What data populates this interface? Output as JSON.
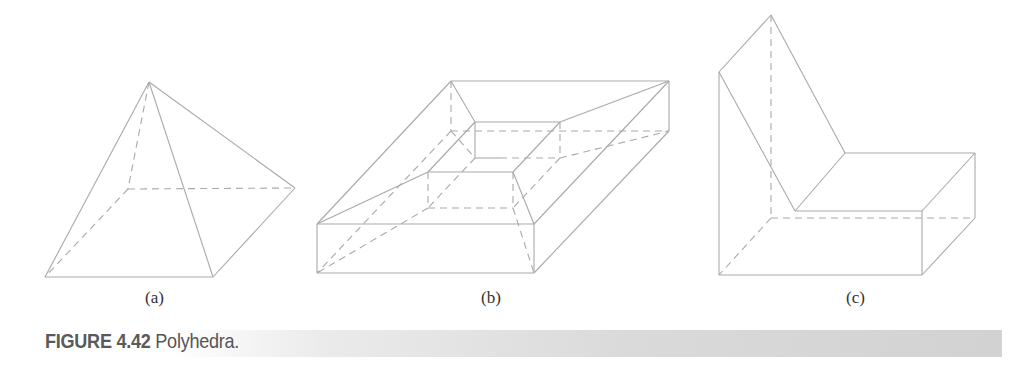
{
  "figure": {
    "number": "FIGURE 4.42",
    "title": "Polyhedra.",
    "panels": [
      {
        "label": "(a)",
        "shape": "square-pyramid"
      },
      {
        "label": "(b)",
        "shape": "frame-with-square-hole"
      },
      {
        "label": "(c)",
        "shape": "L-shaped-bent-prism"
      }
    ]
  },
  "colors": {
    "edge": "#a9a9a9",
    "caption_text": "#555555",
    "caption_bar": "#d2d2d2"
  }
}
